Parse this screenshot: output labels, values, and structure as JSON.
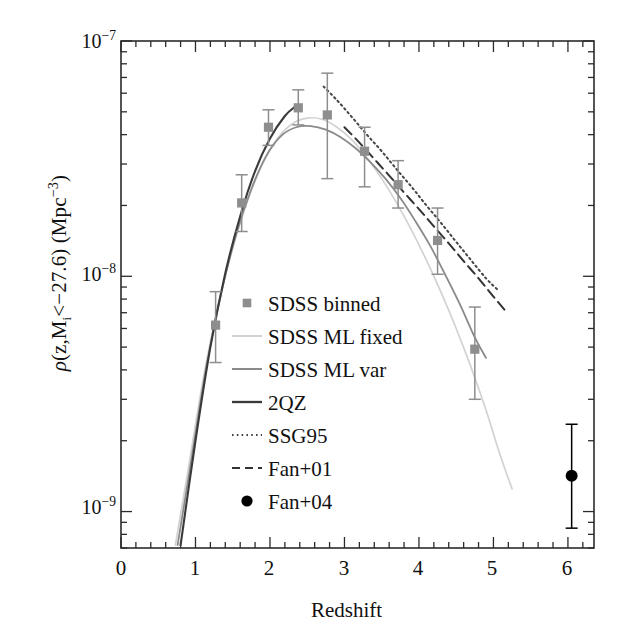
{
  "figure": {
    "title": "",
    "xlabel": "Redshift",
    "ylabel_parts": {
      "rho": "ρ",
      "open": "(z,M",
      "sub": "i",
      "mid": "<−22.6) (Mpc",
      "exp": "−3",
      "close": ")"
    },
    "ylabel_plain": "ρ(z,M_i<−27.6) (Mpc⁻³)"
  },
  "axes": {
    "x": {
      "min": 0,
      "max": 6.35,
      "ticks": [
        0,
        1,
        2,
        3,
        4,
        5,
        6
      ],
      "tick_labels": [
        "0",
        "1",
        "2",
        "3",
        "4",
        "5",
        "6"
      ],
      "minor_step": 0.2,
      "scale": "linear"
    },
    "y": {
      "min": 7e-10,
      "max": 1e-07,
      "scale": "log",
      "ticks": [
        1e-07,
        1e-08,
        1e-09
      ],
      "tick_labels": [
        "10⁻⁷",
        "10⁻⁸",
        "10⁻⁹"
      ],
      "tick_mantissa": [
        "10",
        "10",
        "10"
      ],
      "tick_exponent": [
        "−7",
        "−8",
        "−9"
      ]
    }
  },
  "legend": {
    "items": [
      {
        "label": "SDSS binned",
        "marker": "square-point",
        "color": "#8e8e8e"
      },
      {
        "label": "SDSS ML fixed",
        "marker": "line-solid",
        "color": "#d2d2d2"
      },
      {
        "label": "SDSS ML var",
        "marker": "line-solid",
        "color": "#8a8a8a"
      },
      {
        "label": "2QZ",
        "marker": "line-solid",
        "color": "#3a3a3a"
      },
      {
        "label": "SSG95",
        "marker": "line-dotted",
        "color": "#444444"
      },
      {
        "label": "Fan+01",
        "marker": "line-dashed",
        "color": "#333333"
      },
      {
        "label": "Fan+04",
        "marker": "circle-point",
        "color": "#000000"
      }
    ]
  },
  "chart_data": {
    "type": "scatter",
    "title": "",
    "xlabel": "Redshift",
    "ylabel": "ρ(z,M_i<−27.6) (Mpc⁻³)",
    "xlim": [
      0,
      6.35
    ],
    "ylim": [
      7e-10,
      1e-07
    ],
    "yscale": "log",
    "grid": false,
    "legend_position": "center",
    "series": [
      {
        "name": "SDSS binned",
        "type": "scatter-errorbar",
        "marker": "square",
        "color": "#8e8e8e",
        "points": [
          {
            "x": 1.27,
            "y": 6.2e-09,
            "ylo": 4.3e-09,
            "yhi": 8.6e-09
          },
          {
            "x": 1.62,
            "y": 2.05e-08,
            "ylo": 1.55e-08,
            "yhi": 2.7e-08
          },
          {
            "x": 1.98,
            "y": 4.3e-08,
            "ylo": 3.6e-08,
            "yhi": 5.1e-08
          },
          {
            "x": 2.38,
            "y": 5.2e-08,
            "ylo": 4.4e-08,
            "yhi": 6.2e-08
          },
          {
            "x": 2.77,
            "y": 4.85e-08,
            "ylo": 2.6e-08,
            "yhi": 7.3e-08
          },
          {
            "x": 3.27,
            "y": 3.4e-08,
            "ylo": 2.4e-08,
            "yhi": 4.3e-08
          },
          {
            "x": 3.72,
            "y": 2.45e-08,
            "ylo": 1.95e-08,
            "yhi": 3.1e-08
          },
          {
            "x": 4.25,
            "y": 1.42e-08,
            "ylo": 1.02e-08,
            "yhi": 1.95e-08
          },
          {
            "x": 4.75,
            "y": 4.9e-09,
            "ylo": 3e-09,
            "yhi": 7.4e-09
          }
        ]
      },
      {
        "name": "Fan+04",
        "type": "scatter-errorbar",
        "marker": "circle",
        "color": "#000000",
        "points": [
          {
            "x": 6.05,
            "y": 1.42e-09,
            "ylo": 8.5e-10,
            "yhi": 2.35e-09
          }
        ]
      },
      {
        "name": "SDSS ML fixed",
        "type": "line",
        "style": "solid",
        "color": "#d2d2d2",
        "x": [
          0.73,
          0.9,
          1.1,
          1.3,
          1.5,
          1.7,
          1.9,
          2.1,
          2.3,
          2.5,
          2.7,
          2.9,
          3.1,
          3.3,
          3.5,
          3.7,
          3.9,
          4.1,
          4.3,
          4.5,
          4.7,
          4.9,
          5.1,
          5.25
        ],
        "y": [
          7.2e-10,
          1.5e-09,
          3.6e-09,
          7.4e-09,
          1.32e-08,
          2.1e-08,
          3e-08,
          3.85e-08,
          4.45e-08,
          4.7e-08,
          4.65e-08,
          4.3e-08,
          3.8e-08,
          3.2e-08,
          2.6e-08,
          2.05e-08,
          1.57e-08,
          1.17e-08,
          8.5e-09,
          6e-09,
          4.1e-09,
          2.7e-09,
          1.7e-09,
          1.25e-09
        ]
      },
      {
        "name": "SDSS ML var",
        "type": "line",
        "style": "solid",
        "color": "#8a8a8a",
        "x": [
          0.76,
          0.95,
          1.15,
          1.35,
          1.55,
          1.75,
          1.95,
          2.15,
          2.35,
          2.55,
          2.75,
          2.95,
          3.15,
          3.35,
          3.55,
          3.75,
          3.95,
          4.15,
          4.35,
          4.55,
          4.75,
          4.9
        ],
        "y": [
          7.2e-10,
          1.7e-09,
          4.2e-09,
          8.6e-09,
          1.52e-08,
          2.35e-08,
          3.25e-08,
          3.95e-08,
          4.3e-08,
          4.35e-08,
          4.2e-08,
          3.9e-08,
          3.5e-08,
          3.05e-08,
          2.6e-08,
          2.15e-08,
          1.72e-08,
          1.35e-08,
          1.02e-08,
          7.6e-09,
          5.5e-09,
          4.5e-09
        ]
      },
      {
        "name": "2QZ",
        "type": "line",
        "style": "solid",
        "color": "#3a3a3a",
        "x": [
          0.8,
          1.0,
          1.2,
          1.4,
          1.6,
          1.8,
          2.0,
          2.2,
          2.35
        ],
        "y": [
          7.2e-10,
          2e-09,
          5e-09,
          1.03e-08,
          1.8e-08,
          2.8e-08,
          3.85e-08,
          4.8e-08,
          5.3e-08
        ]
      },
      {
        "name": "SSG95",
        "type": "line",
        "style": "dotted",
        "color": "#444444",
        "x": [
          2.72,
          2.9,
          3.1,
          3.3,
          3.5,
          3.7,
          3.9,
          4.1,
          4.3,
          4.5,
          4.7,
          4.9,
          5.05
        ],
        "y": [
          6.4e-08,
          5.6e-08,
          4.75e-08,
          4e-08,
          3.4e-08,
          2.85e-08,
          2.4e-08,
          2e-08,
          1.68e-08,
          1.4e-08,
          1.17e-08,
          9.8e-09,
          8.8e-09
        ]
      },
      {
        "name": "Fan+01",
        "type": "line",
        "style": "dashed",
        "color": "#333333",
        "x": [
          3.0,
          3.2,
          3.4,
          3.6,
          3.8,
          4.0,
          4.2,
          4.4,
          4.6,
          4.8,
          5.0,
          5.15
        ],
        "y": [
          4.3e-08,
          3.7e-08,
          3.15e-08,
          2.68e-08,
          2.27e-08,
          1.93e-08,
          1.63e-08,
          1.38e-08,
          1.16e-08,
          9.8e-09,
          8.2e-09,
          7.2e-09
        ]
      }
    ]
  }
}
